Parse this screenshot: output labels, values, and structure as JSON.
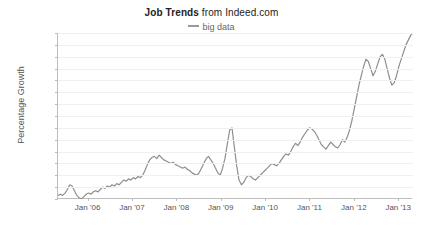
{
  "title": {
    "strong": "Job Trends",
    "rest": " from Indeed.com"
  },
  "legend": {
    "label": "big data",
    "color": "#9a9a9a"
  },
  "axes": {
    "ylabel": "Percentage Growth"
  },
  "chart_data": {
    "type": "line",
    "title": "Job Trends from Indeed.com",
    "xlabel": "",
    "ylabel": "Percentage Growth",
    "ylim": [
      0,
      140
    ],
    "yticks": [
      0,
      10,
      20,
      30,
      40,
      50,
      60,
      70,
      80,
      90,
      100,
      110,
      120,
      130,
      140
    ],
    "xticks": [
      "Jan '06",
      "Jan '07",
      "Jan '08",
      "Jan '09",
      "Jan '10",
      "Jan '11",
      "Jan '12",
      "Jan '13"
    ],
    "xtick_positions": [
      0.0833,
      0.2083,
      0.3333,
      0.4583,
      0.5833,
      0.7083,
      0.8333,
      0.9583
    ],
    "grid": true,
    "legend_position": "top-center",
    "line_color": "#8f8f8f",
    "line_width": 1.2,
    "xrange_label": [
      "mid 2005",
      "mid 2013"
    ],
    "series": [
      {
        "name": "big data",
        "color": "#8f8f8f",
        "values": [
          3,
          4,
          3,
          5,
          8,
          12,
          11,
          7,
          3,
          1,
          0,
          2,
          4,
          5,
          4,
          6,
          7,
          6,
          8,
          10,
          9,
          11,
          10,
          12,
          11,
          13,
          12,
          14,
          16,
          15,
          17,
          16,
          18,
          17,
          19,
          18,
          20,
          24,
          29,
          33,
          35,
          36,
          34,
          37,
          35,
          33,
          32,
          31,
          30,
          31,
          29,
          28,
          27,
          26,
          27,
          25,
          24,
          22,
          21,
          20,
          22,
          26,
          30,
          34,
          36,
          33,
          30,
          26,
          22,
          20,
          26,
          34,
          46,
          58,
          60,
          44,
          28,
          16,
          12,
          14,
          18,
          20,
          19,
          17,
          16,
          18,
          20,
          22,
          24,
          26,
          28,
          30,
          29,
          28,
          30,
          33,
          36,
          38,
          37,
          40,
          44,
          47,
          45,
          48,
          52,
          55,
          58,
          60,
          59,
          57,
          54,
          50,
          46,
          44,
          42,
          45,
          48,
          46,
          44,
          43,
          46,
          50,
          48,
          52,
          58,
          66,
          76,
          86,
          96,
          104,
          112,
          118,
          116,
          110,
          104,
          108,
          114,
          120,
          122,
          118,
          110,
          102,
          96,
          98,
          104,
          112,
          118,
          124,
          130,
          134,
          138,
          140
        ]
      }
    ]
  }
}
